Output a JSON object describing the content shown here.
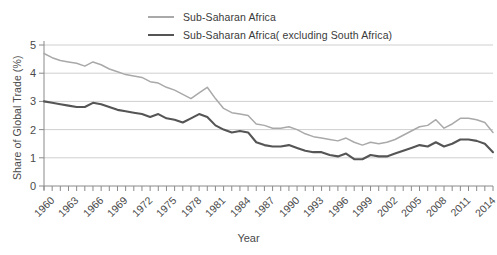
{
  "legend": {
    "position": "top-center",
    "items": [
      {
        "label": "Sub-Saharan Africa",
        "color": "#a9a9a9"
      },
      {
        "label": "Sub-Saharan Africa( excluding South Africa)",
        "color": "#555555"
      }
    ]
  },
  "axes": {
    "y_title": "Share of Global Trade (%)",
    "x_title": "Year",
    "y_ticks": [
      "0",
      "1",
      "2",
      "3",
      "4",
      "5"
    ],
    "x_tick_labels": [
      "1960",
      "1963",
      "1966",
      "1969",
      "1972",
      "1975",
      "1978",
      "1981",
      "1984",
      "1987",
      "1990",
      "1993",
      "1996",
      "1999",
      "2002",
      "2005",
      "2008",
      "2011",
      "2014"
    ]
  },
  "chart_data": {
    "type": "line",
    "title": "",
    "xlabel": "Year",
    "ylabel": "Share of Global Trade (%)",
    "xlim": [
      1960,
      2015
    ],
    "ylim": [
      0,
      5
    ],
    "grid": true,
    "grid_axis": "y",
    "legend_position": "top-center",
    "x": [
      1960,
      1961,
      1962,
      1963,
      1964,
      1965,
      1966,
      1967,
      1968,
      1969,
      1970,
      1971,
      1972,
      1973,
      1974,
      1975,
      1976,
      1977,
      1978,
      1979,
      1980,
      1981,
      1982,
      1983,
      1984,
      1985,
      1986,
      1987,
      1988,
      1989,
      1990,
      1991,
      1992,
      1993,
      1994,
      1995,
      1996,
      1997,
      1998,
      1999,
      2000,
      2001,
      2002,
      2003,
      2004,
      2005,
      2006,
      2007,
      2008,
      2009,
      2010,
      2011,
      2012,
      2013,
      2014,
      2015
    ],
    "series": [
      {
        "name": "Sub-Saharan Africa",
        "color": "#a9a9a9",
        "values": [
          4.7,
          4.55,
          4.45,
          4.4,
          4.35,
          4.25,
          4.4,
          4.3,
          4.15,
          4.05,
          3.95,
          3.9,
          3.85,
          3.7,
          3.65,
          3.5,
          3.4,
          3.25,
          3.1,
          3.3,
          3.5,
          3.1,
          2.75,
          2.6,
          2.55,
          2.5,
          2.2,
          2.15,
          2.05,
          2.05,
          2.1,
          2.0,
          1.85,
          1.75,
          1.7,
          1.65,
          1.6,
          1.7,
          1.55,
          1.45,
          1.55,
          1.5,
          1.55,
          1.65,
          1.8,
          1.95,
          2.1,
          2.15,
          2.35,
          2.05,
          2.2,
          2.4,
          2.4,
          2.35,
          2.25,
          1.9
        ]
      },
      {
        "name": "Sub-Saharan Africa( excluding South Africa)",
        "color": "#555555",
        "values": [
          3.0,
          2.95,
          2.9,
          2.85,
          2.8,
          2.8,
          2.95,
          2.9,
          2.8,
          2.7,
          2.65,
          2.6,
          2.55,
          2.45,
          2.55,
          2.4,
          2.35,
          2.25,
          2.4,
          2.55,
          2.45,
          2.15,
          2.0,
          1.9,
          1.95,
          1.9,
          1.55,
          1.45,
          1.4,
          1.4,
          1.45,
          1.35,
          1.25,
          1.2,
          1.2,
          1.1,
          1.05,
          1.15,
          0.95,
          0.95,
          1.1,
          1.05,
          1.05,
          1.15,
          1.25,
          1.35,
          1.45,
          1.4,
          1.55,
          1.4,
          1.5,
          1.65,
          1.65,
          1.6,
          1.5,
          1.2
        ]
      }
    ]
  }
}
